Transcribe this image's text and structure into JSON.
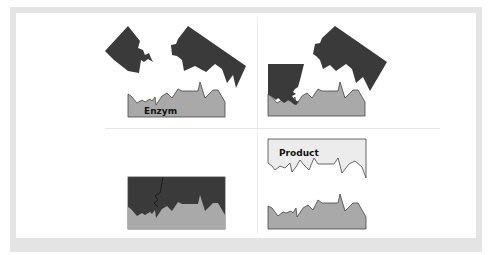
{
  "diagram": {
    "colors": {
      "substrate": "#3a3a3a",
      "enzyme": "#a9a9a9",
      "product": "#ececec",
      "outline": "#444444",
      "frame": "#e4e4e4"
    },
    "panels": [
      {
        "id": "top-left",
        "label": "Enzym",
        "stage": "Substrate pieces approach enzyme"
      },
      {
        "id": "top-right",
        "label": "",
        "stage": "Substrate binding to enzyme"
      },
      {
        "id": "bottom-left",
        "label": "",
        "stage": "Enzyme-substrate complex"
      },
      {
        "id": "bottom-right",
        "label": "Product",
        "stage": "Product released from enzyme"
      }
    ]
  }
}
